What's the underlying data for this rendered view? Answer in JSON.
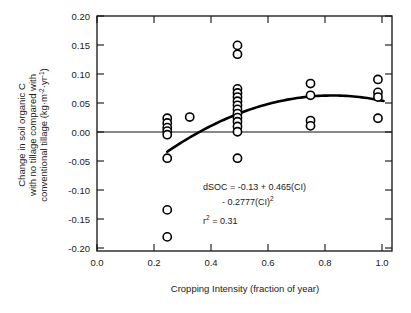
{
  "figure": {
    "title": "",
    "background": "#ffffff",
    "foreground": "#1a1a1a"
  },
  "annotations": {
    "equation_line1": "dSOC = -0.13 + 0.465(CI)",
    "equation_line2": "- 0.2777(CI)",
    "equation_line2_exponent": "2",
    "r2_label": "r",
    "r2_exponent": "2",
    "r2_value": " = 0.31"
  },
  "chart_data": {
    "type": "scatter",
    "title": "",
    "xlabel": "Cropping Intensity (fraction of year)",
    "ylabel": "Change in soil organic C with no tillage compared with conventional tillage (kg·m⁻²·yr⁻¹)",
    "ylabel_line1": "Change in soil organic C",
    "ylabel_line2": "with no tillage compared with",
    "ylabel_line3": "conventional tillage (kg·m",
    "ylabel_line3_sup1": "-2",
    "ylabel_line3_mid": "·yr",
    "ylabel_line3_sup2": "-1",
    "ylabel_line3_end": ")",
    "xlim": [
      0.0,
      1.05
    ],
    "ylim": [
      -0.2,
      0.2
    ],
    "xticks": [
      0.0,
      0.2,
      0.4,
      0.6,
      0.8,
      1.0
    ],
    "xticklabels": [
      "0.0",
      "0.2",
      "0.4",
      "0.6",
      "0.8",
      "1.0"
    ],
    "yticks": [
      -0.2,
      -0.15,
      -0.1,
      -0.05,
      0.0,
      0.05,
      0.1,
      0.15,
      0.2
    ],
    "yticklabels": [
      "-0.20",
      "-0.15",
      "-0.10",
      "-0.05",
      "0.00",
      "0.05",
      "0.10",
      "0.15",
      "0.20"
    ],
    "grid": false,
    "legend": null,
    "zero_reference_line": 0.0,
    "marker": "open-circle",
    "marker_color": "#000000",
    "marker_fill": "#ffffff",
    "points": [
      {
        "x": 0.25,
        "y": 0.026
      },
      {
        "x": 0.25,
        "y": 0.018
      },
      {
        "x": 0.25,
        "y": 0.01
      },
      {
        "x": 0.25,
        "y": 0.004
      },
      {
        "x": 0.25,
        "y": -0.002
      },
      {
        "x": 0.25,
        "y": -0.042
      },
      {
        "x": 0.25,
        "y": -0.13
      },
      {
        "x": 0.25,
        "y": -0.176
      },
      {
        "x": 0.33,
        "y": 0.028
      },
      {
        "x": 0.5,
        "y": 0.15
      },
      {
        "x": 0.5,
        "y": 0.135
      },
      {
        "x": 0.5,
        "y": 0.076
      },
      {
        "x": 0.5,
        "y": 0.069
      },
      {
        "x": 0.5,
        "y": 0.062
      },
      {
        "x": 0.5,
        "y": 0.055
      },
      {
        "x": 0.5,
        "y": 0.048
      },
      {
        "x": 0.5,
        "y": 0.041
      },
      {
        "x": 0.5,
        "y": 0.034
      },
      {
        "x": 0.5,
        "y": 0.027
      },
      {
        "x": 0.5,
        "y": 0.02
      },
      {
        "x": 0.5,
        "y": 0.012
      },
      {
        "x": 0.5,
        "y": 0.003
      },
      {
        "x": 0.5,
        "y": -0.042
      },
      {
        "x": 0.76,
        "y": 0.085
      },
      {
        "x": 0.76,
        "y": 0.065
      },
      {
        "x": 0.76,
        "y": 0.022
      },
      {
        "x": 0.76,
        "y": 0.013
      },
      {
        "x": 1.0,
        "y": 0.092
      },
      {
        "x": 1.0,
        "y": 0.07
      },
      {
        "x": 1.0,
        "y": 0.062
      },
      {
        "x": 1.0,
        "y": 0.026
      }
    ],
    "fit": {
      "equation": "dSOC = -0.13 + 0.465(CI) - 0.2777(CI)^2",
      "intercept": -0.13,
      "linear_coef": 0.465,
      "quadratic_coef": -0.2777,
      "r_squared": 0.31,
      "x_start": 0.25,
      "x_end": 1.02
    }
  }
}
